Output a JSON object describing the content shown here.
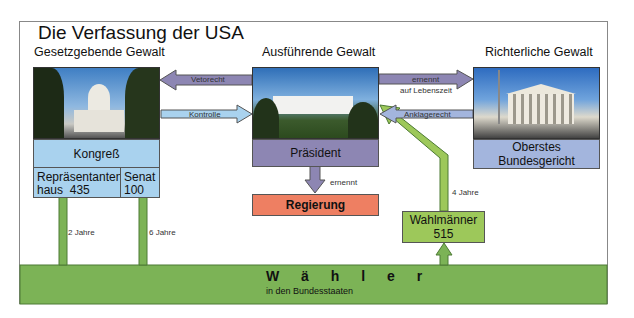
{
  "title": "Die Verfassung der USA",
  "branches": {
    "legislative": {
      "heading": "Gesetzgebende Gewalt",
      "body": "Kongreß",
      "house_label": "Repräsentanten-",
      "house_label2": "haus",
      "house_count": "435",
      "senate_label": "Senat",
      "senate_count": "100"
    },
    "executive": {
      "heading": "Ausführende Gewalt",
      "body": "Präsident",
      "appoints": "Regierung"
    },
    "judicial": {
      "heading": "Richterliche Gewalt",
      "body_line1": "Oberstes",
      "body_line2": "Bundesgericht"
    }
  },
  "arrows": {
    "veto": "Vetorecht",
    "control": "Kontrolle",
    "appoints_judges": "ernennt",
    "appoints_judges_sub": "auf Lebenszeit",
    "impeachment": "Anklagerecht",
    "appoints_gov": "ernennt",
    "house_term": "2 Jahre",
    "senate_term": "6 Jahre",
    "president_term": "4 Jahre"
  },
  "electors": {
    "label": "Wahlmänner",
    "count": "515"
  },
  "voters": {
    "label": "W ä h l e r",
    "sub": "in den Bundesstaaten"
  },
  "colors": {
    "green": "#7cb356",
    "lightgreen": "#9dc85a",
    "blue": "#a9d2ee",
    "purple": "#8d86b3",
    "bluegray": "#a3b5dd",
    "red": "#ee7f62"
  }
}
